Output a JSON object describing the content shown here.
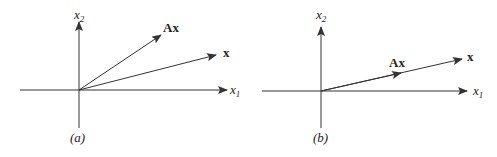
{
  "figure": {
    "panels": [
      {
        "id": "a",
        "caption": "(a)",
        "axes": {
          "x1_label": "x",
          "x1_sub": "1",
          "x2_label": "x",
          "x2_sub": "2"
        },
        "vectors": [
          {
            "name": "x",
            "label": "x"
          },
          {
            "name": "Ax",
            "label": "Ax"
          }
        ]
      },
      {
        "id": "b",
        "caption": "(b)",
        "axes": {
          "x1_label": "x",
          "x1_sub": "1",
          "x2_label": "x",
          "x2_sub": "2"
        },
        "vectors": [
          {
            "name": "x",
            "label": "x"
          },
          {
            "name": "Ax",
            "label": "Ax"
          }
        ]
      }
    ],
    "colors": {
      "line": "#333333",
      "text": "#222222"
    }
  }
}
